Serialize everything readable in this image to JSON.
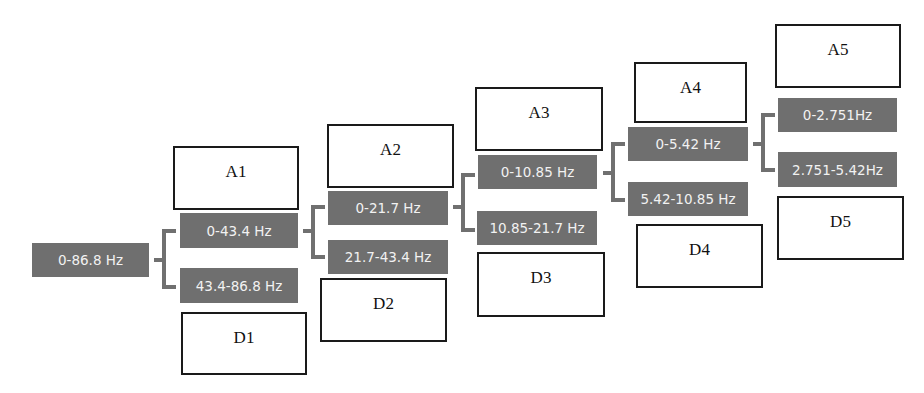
{
  "diagram": {
    "type": "wavelet-decomposition-tree",
    "root": {
      "label": "0-86.8 Hz"
    },
    "levels": [
      {
        "approx_box": "A1",
        "detail_box": "D1",
        "low_band": "0-43.4 Hz",
        "high_band": "43.4-86.8 Hz"
      },
      {
        "approx_box": "A2",
        "detail_box": "D2",
        "low_band": "0-21.7 Hz",
        "high_band": "21.7-43.4 Hz"
      },
      {
        "approx_box": "A3",
        "detail_box": "D3",
        "low_band": "0-10.85 Hz",
        "high_band": "10.85-21.7 Hz"
      },
      {
        "approx_box": "A4",
        "detail_box": "D4",
        "low_band": "0-5.42 Hz",
        "high_band": "5.42-10.85 Hz"
      },
      {
        "approx_box": "A5",
        "detail_box": "D5",
        "low_band": "0-2.751Hz",
        "high_band": "2.751-5.42Hz"
      }
    ]
  },
  "colors": {
    "band_fill": "#6f6f6f",
    "band_text": "#f2f2f2",
    "bracket": "#707070",
    "box_border": "#1a1a1a"
  }
}
